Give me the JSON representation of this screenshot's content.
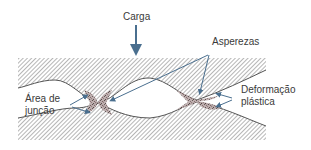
{
  "diagram": {
    "labels": {
      "load": "Carga",
      "asperities": "Asperezas",
      "junction_area_line1": "Área de",
      "junction_area_line2": "junção",
      "plastic_deformation_line1": "Deformação",
      "plastic_deformation_line2": "plástica"
    },
    "colors": {
      "arrow": "#4a6f8f",
      "hatch": "#6e6e6e",
      "outline": "#555555",
      "deformation": "#8a7070",
      "text": "#3a3a3a"
    }
  }
}
